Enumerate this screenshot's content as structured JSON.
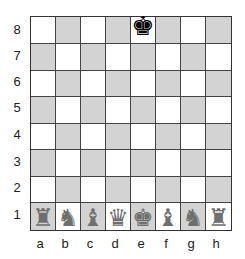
{
  "board": {
    "files": [
      "a",
      "b",
      "c",
      "d",
      "e",
      "f",
      "g",
      "h"
    ],
    "ranks": [
      "8",
      "7",
      "6",
      "5",
      "4",
      "3",
      "2",
      "1"
    ],
    "colors": {
      "light": "#ffffff",
      "dark": "#d3d3d3",
      "white_pieces": "#6f6f6f",
      "black_pieces": "#000000"
    },
    "pieces": [
      {
        "square": "e8",
        "color": "black",
        "type": "king",
        "glyph": "♚"
      },
      {
        "square": "a1",
        "color": "white",
        "type": "rook",
        "glyph": "♜"
      },
      {
        "square": "b1",
        "color": "white",
        "type": "knight",
        "glyph": "♞"
      },
      {
        "square": "c1",
        "color": "white",
        "type": "bishop",
        "glyph": "♝"
      },
      {
        "square": "d1",
        "color": "white",
        "type": "queen",
        "glyph": "♛"
      },
      {
        "square": "e1",
        "color": "white",
        "type": "king",
        "glyph": "♚"
      },
      {
        "square": "f1",
        "color": "white",
        "type": "bishop",
        "glyph": "♝"
      },
      {
        "square": "g1",
        "color": "white",
        "type": "knight",
        "glyph": "♞"
      },
      {
        "square": "h1",
        "color": "white",
        "type": "rook",
        "glyph": "♜"
      }
    ]
  },
  "labels": {
    "ranks": [
      "8",
      "7",
      "6",
      "5",
      "4",
      "3",
      "2",
      "1"
    ],
    "files": [
      "a",
      "b",
      "c",
      "d",
      "e",
      "f",
      "g",
      "h"
    ]
  }
}
